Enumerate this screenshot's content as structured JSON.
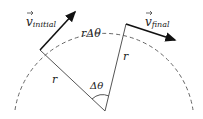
{
  "diagram": {
    "labels": {
      "v_initial": "v",
      "v_initial_sub": "initial",
      "v_final": "v",
      "v_final_sub": "final",
      "arc_length": "rΔθ",
      "radius_left": "r",
      "radius_right": "r",
      "angle": "Δθ"
    },
    "colors": {
      "line": "#555555",
      "arrow": "#111111",
      "dash": "#666666"
    }
  }
}
